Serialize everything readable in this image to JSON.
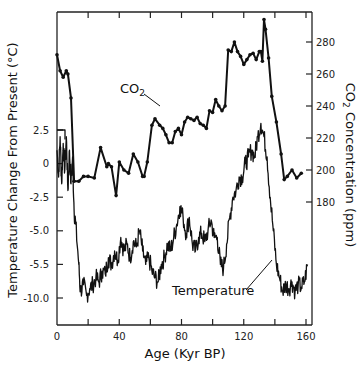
{
  "chart_data": {
    "type": "line",
    "title": "",
    "xlabel": "Age (Kyr BP)",
    "ylabel_left": "Temperature Change From Present (°C)",
    "ylabel_right_prefix": "CO",
    "ylabel_right_sub": "2",
    "ylabel_right_suffix": " Concentration (ppm)",
    "xlim": [
      0,
      160
    ],
    "x_ticks": [
      0,
      40,
      80,
      120,
      160
    ],
    "x_minor_ticks": [
      20,
      60,
      100,
      140
    ],
    "left_ticks": [
      {
        "label": "2.5",
        "value": 2.5
      },
      {
        "label": "0",
        "value": 0
      },
      {
        "label": "-2.5",
        "value": -2.5
      },
      {
        "label": "-5.0",
        "value": -5.0
      },
      {
        "label": "-5.5",
        "value": -7.5
      },
      {
        "label": "-10.0",
        "value": -10.0
      }
    ],
    "left_ylim": [
      -12.5,
      12.5
    ],
    "right_ticks": [
      280,
      260,
      240,
      220,
      200,
      180
    ],
    "right_ylim": [
      155,
      300
    ],
    "grid": false,
    "annotations": {
      "co2_label": "CO",
      "co2_label_sub": "2",
      "temp_label": "Temperature"
    },
    "series": [
      {
        "name": "CO2",
        "axis": "right",
        "marker": "dot",
        "x": [
          0,
          2,
          4,
          6,
          7,
          9,
          11,
          14,
          17,
          20,
          24,
          28,
          32,
          33,
          35,
          38,
          40,
          43,
          46,
          49,
          52,
          55,
          56,
          58,
          61,
          63,
          66,
          68,
          70,
          72,
          74,
          76,
          78,
          80,
          82,
          84,
          86,
          88,
          90,
          92,
          94,
          96,
          98,
          100,
          102,
          104,
          106,
          108,
          110,
          112,
          114,
          116,
          118,
          120,
          122,
          124,
          126,
          128,
          130,
          131,
          132,
          133,
          134,
          136,
          138,
          141,
          144,
          146,
          148,
          151,
          154,
          157
        ],
        "values": [
          272,
          262,
          258,
          262,
          260,
          245,
          193,
          193,
          196,
          196,
          195,
          214,
          202,
          204,
          202,
          184,
          205,
          200,
          198,
          210,
          205,
          196,
          196,
          205,
          228,
          232,
          228,
          226,
          222,
          217,
          217,
          224,
          226,
          222,
          230,
          233,
          232,
          231,
          233,
          229,
          228,
          226,
          237,
          236,
          244,
          240,
          237,
          240,
          275,
          274,
          280,
          274,
          271,
          266,
          269,
          272,
          273,
          269,
          274,
          274,
          268,
          294,
          288,
          270,
          246,
          230,
          210,
          194,
          196,
          200,
          195,
          198
        ]
      },
      {
        "name": "Temperature",
        "axis": "left",
        "marker": "none",
        "x": [
          0,
          1,
          2,
          3,
          4,
          5,
          6,
          7,
          8,
          9,
          10,
          11,
          12,
          14,
          15,
          17,
          19,
          21,
          23,
          25,
          27,
          29,
          31,
          33,
          35,
          37,
          39,
          41,
          43,
          45,
          47,
          49,
          51,
          53,
          55,
          57,
          59,
          61,
          63,
          65,
          67,
          69,
          71,
          73,
          75,
          77,
          79,
          81,
          83,
          85,
          87,
          89,
          91,
          93,
          95,
          97,
          99,
          101,
          103,
          105,
          107,
          109,
          111,
          113,
          115,
          117,
          119,
          121,
          123,
          125,
          127,
          129,
          131,
          133,
          135,
          137,
          139,
          141,
          143,
          145,
          147,
          149,
          151,
          153,
          155,
          157,
          159,
          161
        ],
        "values": [
          1.0,
          -1.0,
          2.0,
          -1.5,
          1.5,
          -0.5,
          2.0,
          -2.0,
          1.0,
          -1.5,
          0.5,
          -3.5,
          -4.5,
          -7.5,
          -9.5,
          -9.0,
          -9.8,
          -9.3,
          -9.0,
          -8.5,
          -8.8,
          -8.0,
          -8.2,
          -7.0,
          -7.5,
          -6.5,
          -7.2,
          -5.5,
          -6.5,
          -6.0,
          -7.0,
          -5.8,
          -6.2,
          -5.0,
          -6.5,
          -7.5,
          -7.0,
          -8.0,
          -8.5,
          -8.8,
          -7.5,
          -7.0,
          -6.0,
          -6.5,
          -5.5,
          -4.5,
          -3.2,
          -4.0,
          -5.2,
          -4.0,
          -6.0,
          -6.5,
          -5.5,
          -5.2,
          -5.8,
          -5.0,
          -4.2,
          -5.5,
          -5.5,
          -7.5,
          -7.8,
          -6.0,
          -4.0,
          -2.5,
          -2.0,
          -1.0,
          -1.0,
          0.0,
          0.5,
          1.0,
          0.5,
          2.0,
          3.0,
          2.0,
          0.5,
          -2.5,
          -5.0,
          -7.5,
          -8.5,
          -9.5,
          -9.0,
          -9.3,
          -8.8,
          -9.5,
          -9.0,
          -9.2,
          -8.8,
          -7.5
        ]
      }
    ]
  }
}
